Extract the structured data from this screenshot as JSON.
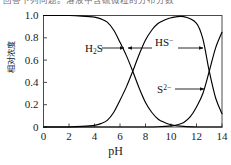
{
  "caption": {
    "text": "回答下列问题。溶液中含硫微粒的分布分数"
  },
  "chart_data": {
    "type": "line",
    "title": "",
    "subtitle": "",
    "xlabel": "pH",
    "ylabel": "相对浓度",
    "xlim": [
      0,
      14
    ],
    "ylim": [
      0,
      1.0
    ],
    "grid": false,
    "legend_position": "inline-annotations",
    "xticks": [
      0,
      2,
      4,
      6,
      8,
      10,
      12,
      14
    ],
    "xtick_labels": [
      "0",
      "2",
      "4",
      "6",
      "8",
      "10",
      "12",
      "14"
    ],
    "yticks": [
      0,
      0.2,
      0.4,
      0.6,
      0.8,
      1.0
    ],
    "ytick_labels": [
      "0",
      "0.2",
      "0.4",
      "0.6",
      "0.8",
      "1.0"
    ],
    "crossing_points": [
      {
        "x": 7.0,
        "y": 0.5,
        "between": "H2S / HS-"
      },
      {
        "x": 12.9,
        "y": 0.5,
        "between": "HS- / S2-"
      }
    ],
    "series": [
      {
        "name": "H2S",
        "label": "H₂S",
        "color": "#000000",
        "x": [
          0,
          1,
          2,
          3,
          4,
          4.5,
          5,
          5.5,
          6,
          6.5,
          7,
          7.5,
          8,
          8.5,
          9,
          9.5,
          10,
          11,
          12,
          13,
          14
        ],
        "values": [
          1.0,
          1.0,
          1.0,
          0.995,
          0.985,
          0.97,
          0.94,
          0.87,
          0.76,
          0.64,
          0.5,
          0.35,
          0.22,
          0.13,
          0.07,
          0.04,
          0.02,
          0.005,
          0.0,
          0.0,
          0.0
        ]
      },
      {
        "name": "HS-",
        "label": "HS⁻",
        "color": "#000000",
        "x": [
          0,
          1,
          2,
          3,
          4,
          4.5,
          5,
          5.5,
          6,
          6.5,
          7,
          7.5,
          8,
          8.5,
          9,
          9.5,
          10,
          11,
          12,
          12.5,
          13,
          13.5,
          14
        ],
        "values": [
          0.0,
          0.0,
          0.0,
          0.005,
          0.015,
          0.03,
          0.06,
          0.13,
          0.24,
          0.36,
          0.5,
          0.65,
          0.78,
          0.87,
          0.93,
          0.96,
          0.98,
          0.99,
          0.93,
          0.79,
          0.5,
          0.26,
          0.12
        ]
      },
      {
        "name": "S2-",
        "label": "S²⁻",
        "color": "#000000",
        "x": [
          0,
          2,
          4,
          6,
          8,
          9,
          10,
          10.5,
          11,
          11.5,
          12,
          12.5,
          13,
          13.5,
          14
        ],
        "values": [
          0.0,
          0.0,
          0.0,
          0.0,
          0.0,
          0.002,
          0.01,
          0.02,
          0.04,
          0.09,
          0.18,
          0.3,
          0.5,
          0.71,
          0.85
        ]
      }
    ],
    "annotations": [
      {
        "name": "H2S",
        "label": "H₂S",
        "text_x": 85,
        "text_y": 42,
        "arrow_from_x": 102,
        "arrow_to_x": 124,
        "arrow_y": 48,
        "direction": "right"
      },
      {
        "name": "HS-",
        "label": "HS⁻",
        "text_x": 155,
        "text_y": 36,
        "arrow_left_from_x": 128,
        "arrow_left_to_x": 152,
        "arrow_right_from_x": 178,
        "arrow_right_to_x": 203,
        "arrow_y": 48,
        "direction": "both"
      },
      {
        "name": "S2-",
        "label": "S²⁻",
        "text_x": 157,
        "text_y": 83,
        "arrow_from_x": 175,
        "arrow_to_x": 204,
        "arrow_y": 89,
        "direction": "right"
      }
    ]
  },
  "axes": {
    "frame_color": "#4a4a4a",
    "curve_color": "#000000",
    "background": "#ffffff"
  }
}
